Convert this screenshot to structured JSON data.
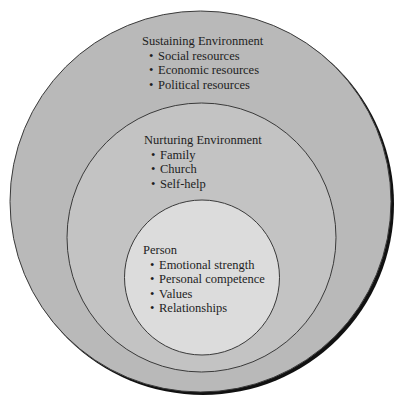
{
  "colors": {
    "background": "#ffffff",
    "outer_fill": "#b9b9b9",
    "middle_fill": "#c3c3c3",
    "inner_fill": "#dcdcdc",
    "stroke": "#3a3a3a",
    "shadow": "#111111"
  },
  "rings": [
    {
      "title": "Sustaining Environment",
      "items": [
        "Social resources",
        "Economic resources",
        "Political resources"
      ]
    },
    {
      "title": "Nurturing Environment",
      "items": [
        "Family",
        "Church",
        "Self-help"
      ]
    },
    {
      "title": "Person",
      "items": [
        "Emotional strength",
        "Personal competence",
        "Values",
        "Relationships"
      ]
    }
  ],
  "bullet": "•"
}
